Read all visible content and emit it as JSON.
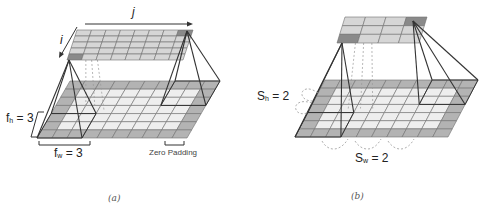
{
  "figure": {
    "panels": [
      {
        "id": "a",
        "caption": "(a)",
        "labels": {
          "output_col_index": "j",
          "output_row_index": "i",
          "filter_height_label": "f",
          "filter_height_sub": "h",
          "filter_height_value": " = 3",
          "filter_width_label": "f",
          "filter_width_sub": "w",
          "filter_width_value": " = 3",
          "padding_label": "Zero Padding"
        },
        "output_grid": {
          "rows": 5,
          "cols": 8
        },
        "input_grid": {
          "rows": 7,
          "cols": 10,
          "padding": 1
        }
      },
      {
        "id": "b",
        "caption": "(b)",
        "labels": {
          "stride_height_label": "S",
          "stride_height_sub": "h",
          "stride_height_value": " = 2",
          "stride_width_label": "S",
          "stride_width_sub": "w",
          "stride_width_value": " = 2"
        },
        "output_grid": {
          "rows": 3,
          "cols": 4
        },
        "input_grid": {
          "rows": 7,
          "cols": 10,
          "padding": 1
        }
      }
    ],
    "colors": {
      "padding_cell": "#b3b3b3",
      "inner_cell": "#eeeeee",
      "output_cell": "#d6d6d6",
      "highlight_cell": "#8a8a8a",
      "grid_line": "#6e6e6e",
      "frame_line": "#333333",
      "dashed_line": "#9a9a9a"
    }
  }
}
